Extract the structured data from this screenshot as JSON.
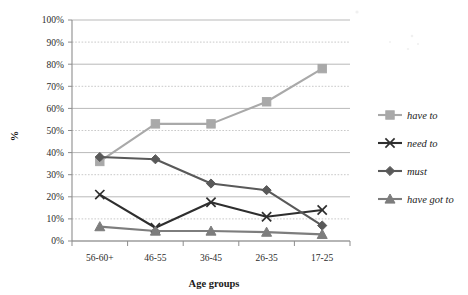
{
  "chart_data": {
    "type": "line",
    "title": "",
    "xlabel": "Age groups",
    "ylabel": "%",
    "categories": [
      "56-60+",
      "46-55",
      "36-45",
      "26-35",
      "17-25"
    ],
    "ylim": [
      0,
      100
    ],
    "ytick_labels": [
      "0%",
      "10%",
      "20%",
      "30%",
      "40%",
      "50%",
      "60%",
      "70%",
      "80%",
      "90%",
      "100%"
    ],
    "ytick_values": [
      0,
      10,
      20,
      30,
      40,
      50,
      60,
      70,
      80,
      90,
      100
    ],
    "grid": "horizontal",
    "legend_position": "right",
    "series": [
      {
        "name": "have to",
        "values": [
          36,
          53,
          53,
          63,
          78
        ],
        "color": "#a9a9a9",
        "marker": "square"
      },
      {
        "name": "need to",
        "values": [
          21,
          6,
          17.5,
          11,
          14
        ],
        "color": "#2e2e2e",
        "marker": "x"
      },
      {
        "name": "must",
        "values": [
          38,
          37,
          26,
          23,
          7
        ],
        "color": "#595959",
        "marker": "diamond"
      },
      {
        "name": "have got to",
        "values": [
          6.5,
          4.5,
          4.5,
          4,
          3
        ],
        "color": "#7d7d7d",
        "marker": "triangle"
      }
    ]
  },
  "axes": {
    "y_axis_label": "%",
    "x_axis_label": "Age groups"
  },
  "legend": {
    "items": [
      {
        "label": "have to"
      },
      {
        "label": "need to"
      },
      {
        "label": "must"
      },
      {
        "label": "have got to"
      }
    ]
  }
}
